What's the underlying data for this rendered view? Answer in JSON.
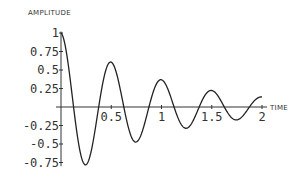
{
  "chart_data": {
    "type": "line",
    "title": "",
    "xlabel": "TIME",
    "ylabel": "AMPLITUDE",
    "xlim": [
      0,
      2
    ],
    "ylim": [
      -0.78,
      1
    ],
    "grid": false,
    "legend": null,
    "x_ticks": [
      0.5,
      1,
      1.5,
      2
    ],
    "x_tick_labels": [
      "0.5",
      "1",
      "1.5",
      "2"
    ],
    "y_ticks": [
      1,
      0.75,
      0.5,
      0.25,
      -0.25,
      -0.5,
      -0.75
    ],
    "y_tick_labels": [
      "1",
      "0.75",
      "0.5",
      "0.25",
      "-0.25",
      "-0.5",
      "-0.75"
    ],
    "function": "exp(-t)*cos(4*pi*t)",
    "series": [
      {
        "name": "amplitude",
        "x": [
          0,
          0.125,
          0.25,
          0.375,
          0.5,
          0.625,
          0.75,
          0.875,
          1.0,
          1.125,
          1.25,
          1.375,
          1.5,
          1.625,
          1.75,
          1.875,
          2.0
        ],
        "values": [
          1.0,
          0.0,
          -0.78,
          0.0,
          0.61,
          0.0,
          -0.47,
          0.0,
          0.37,
          0.0,
          -0.29,
          0.0,
          0.22,
          0.0,
          -0.17,
          0.0,
          0.14
        ]
      }
    ],
    "colors": {
      "line": "#222222",
      "axis": "#333333"
    }
  }
}
